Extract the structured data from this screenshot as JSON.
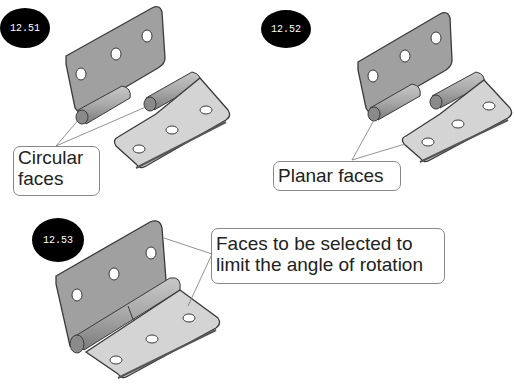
{
  "figures": [
    {
      "id": "12.51",
      "label": "12.51",
      "callout": [
        "Circular",
        "faces"
      ]
    },
    {
      "id": "12.52",
      "label": "12.52",
      "callout": [
        "Planar faces"
      ]
    },
    {
      "id": "12.53",
      "label": "12.53",
      "callout": [
        "Faces to be selected to",
        "limit the angle of rotation"
      ]
    }
  ],
  "colors": {
    "leaf_dark": "#9c9c9c",
    "leaf_light": "#d6d6d6",
    "edge": "#3a3a3a",
    "leader": "#777777",
    "badge": "#000000"
  }
}
